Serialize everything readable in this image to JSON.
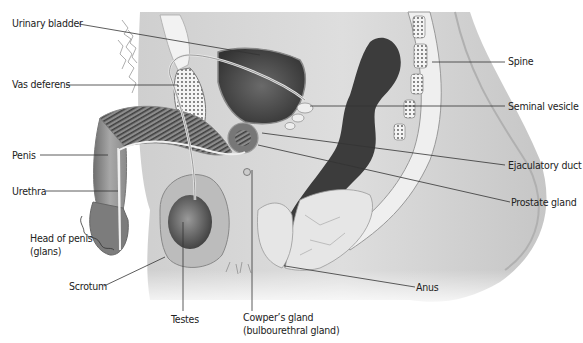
{
  "diagram": {
    "colors": {
      "text": "#222222",
      "leader": "#333333",
      "body_light": "#e4e4e4",
      "body_mid": "#b9b9b9",
      "body_dark": "#4a4a4a",
      "bone": "#f2f2f2"
    },
    "labels": {
      "urinary_bladder": "Urinary bladder",
      "vas_deferens": "Vas deferens",
      "penis": "Penis",
      "urethra": "Urethra",
      "head_of_penis_line1": "Head of penis",
      "head_of_penis_line2": "(glans)",
      "scrotum": "Scrotum",
      "testes": "Testes",
      "cowpers_line1": "Cowper’s gland",
      "cowpers_line2": "(bulbourethral gland)",
      "spine": "Spine",
      "seminal_vesicle": "Seminal vesicle",
      "ejaculatory_duct": "Ejaculatory duct",
      "prostate_gland": "Prostate gland",
      "anus": "Anus"
    }
  }
}
